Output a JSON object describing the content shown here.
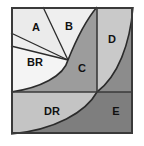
{
  "figure": {
    "type": "geometric-diagram",
    "canvas": {
      "width": 144,
      "height": 146
    },
    "background_color": "#ffffff",
    "frame": {
      "x": 11,
      "y": 7,
      "width": 122,
      "height": 127,
      "border_color": "#3a3a3a",
      "border_width": 2
    },
    "dividers": {
      "vertical_x": 97,
      "horizontal_y": 92,
      "color": "#3a3a3a",
      "width": 1.6
    },
    "spiral_pole": {
      "x": 68,
      "y": 60
    },
    "curve_color": "#2b2b2b",
    "curve_width": 1.6,
    "regions": [
      {
        "id": "A",
        "label": "A",
        "fill": "#ebebeb",
        "label_x": 36,
        "label_y": 31,
        "font_size": 11
      },
      {
        "id": "B",
        "label": "B",
        "fill": "#efefef",
        "label_x": 69,
        "label_y": 30,
        "font_size": 11
      },
      {
        "id": "BR",
        "label": "BR",
        "fill": "#f2f2f2",
        "label_x": 35,
        "label_y": 66,
        "font_size": 11
      },
      {
        "id": "C",
        "label": "C",
        "fill": "#9c9c9c",
        "label_x": 82,
        "label_y": 72,
        "font_size": 11
      },
      {
        "id": "D",
        "label": "D",
        "fill": "#c9c9c9",
        "label_x": 110,
        "label_y": 43,
        "font_size": 11
      },
      {
        "id": "DR",
        "label": "DR",
        "fill": "#c4c4c4",
        "label_x": 52,
        "label_y": 115,
        "font_size": 11
      },
      {
        "id": "E",
        "label": "E",
        "fill": "#7e7e7e",
        "label_x": 116,
        "label_y": 115,
        "font_size": 11
      }
    ],
    "radial_lines": [
      {
        "name": "ray-to-top-edge",
        "x1": 68,
        "y1": 60,
        "x2": 43,
        "y2": 7
      },
      {
        "name": "ray-to-left-edge-upper",
        "x1": 68,
        "y1": 60,
        "x2": 11,
        "y2": 33
      },
      {
        "name": "ray-to-left-edge-lower",
        "x1": 68,
        "y1": 60,
        "x2": 11,
        "y2": 46
      }
    ]
  }
}
